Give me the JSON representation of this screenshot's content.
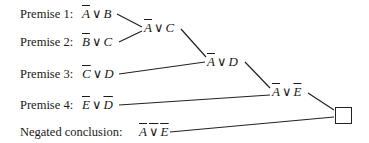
{
  "premises": [
    {
      "label": "Premise 1:",
      "left": "A",
      "left_negated": true,
      "op": "∨",
      "right": "B",
      "right_negated": false
    },
    {
      "label": "Premise 2:",
      "left": "B",
      "left_negated": true,
      "op": "∨",
      "right": "C",
      "right_negated": false
    },
    {
      "label": "Premise 3:",
      "left": "C",
      "left_negated": true,
      "op": "∨",
      "right": "D",
      "right_negated": false
    },
    {
      "label": "Premise 4:",
      "left": "E",
      "left_negated": true,
      "op": "∨",
      "right": "D",
      "right_negated": true
    }
  ],
  "negated_conclusion": {
    "label": "Negated conclusion:",
    "left": "A",
    "op": "∨",
    "right": "E",
    "whole_negated": true
  },
  "resolvents": [
    {
      "left": "A",
      "left_negated": true,
      "op": "∨",
      "right": "C",
      "right_negated": false
    },
    {
      "left": "A",
      "left_negated": true,
      "op": "∨",
      "right": "D",
      "right_negated": false
    },
    {
      "left": "A",
      "left_negated": true,
      "op": "∨",
      "right": "E",
      "right_negated": true
    }
  ],
  "empty_clause": "□"
}
